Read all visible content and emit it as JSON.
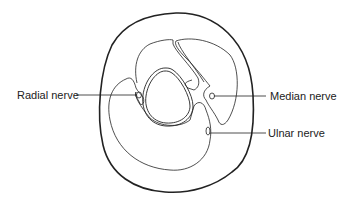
{
  "diagram": {
    "type": "anatomical cross-section",
    "labels": {
      "radial": "Radial nerve",
      "median": "Median nerve",
      "ulnar": "Ulnar nerve"
    },
    "colors": {
      "stroke": "#222222",
      "background": "#ffffff"
    }
  }
}
